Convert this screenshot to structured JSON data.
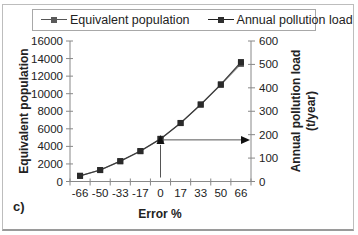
{
  "panel_label": "c)",
  "legend": {
    "items": [
      {
        "label": "Equivalent population",
        "color": "#5a5a5a"
      },
      {
        "label": "Annual pollution load",
        "color": "#2e2e2e"
      }
    ]
  },
  "axes": {
    "xlabel": "Error %",
    "ylabel_left": "Equivalent population",
    "ylabel_right_line1": "Annual pollution load",
    "ylabel_right_line2": "(t/year)"
  },
  "chart_data": {
    "type": "line",
    "title": "",
    "panel": "c)",
    "categories": [
      "-66",
      "-50",
      "-33",
      "-17",
      "0",
      "17",
      "33",
      "50",
      "66"
    ],
    "series": [
      {
        "name": "Equivalent population",
        "axis": "left",
        "values": [
          650,
          1300,
          2300,
          3450,
          4850,
          6650,
          8750,
          11000,
          13400
        ]
      },
      {
        "name": "Annual pollution load",
        "axis": "right",
        "values": [
          24,
          49,
          87,
          130,
          182,
          250,
          329,
          415,
          510
        ]
      }
    ],
    "xlabel": "Error %",
    "ylabel": "Equivalent population",
    "ylabel_right": "Annual pollution load (t/year)",
    "ylim": [
      0,
      16000
    ],
    "ylim_right": [
      0,
      600
    ],
    "yticks": [
      0,
      2000,
      4000,
      6000,
      8000,
      10000,
      12000,
      14000,
      16000
    ],
    "yticks_right": [
      0,
      100,
      200,
      300,
      400,
      500,
      600
    ],
    "grid": false,
    "legend_position": "top",
    "annotations": [
      {
        "type": "arrow",
        "direction": "up",
        "from_x": "0",
        "to_value": 4850,
        "note": "vertical arrow from x-axis at Error 0% up to curve"
      },
      {
        "type": "arrow",
        "direction": "right",
        "at_value_right": 182,
        "note": "horizontal arrow from curve to right axis"
      }
    ]
  }
}
